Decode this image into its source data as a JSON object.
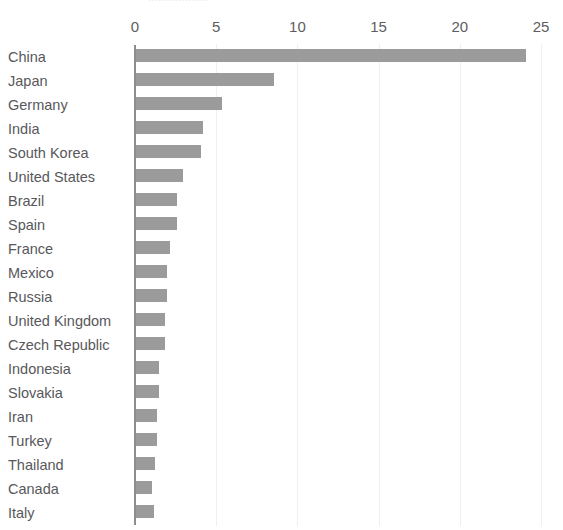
{
  "title_remnant": "..................",
  "colors": {
    "bar": "#9b9b9b",
    "gridline": "#efeff1",
    "axis": "#8d8d8d",
    "label_text": "#58585b",
    "tick_text": "#5d5d60",
    "background": "#ffffff"
  },
  "chart_data": {
    "type": "bar",
    "orientation": "horizontal",
    "title": "",
    "xlabel": "",
    "ylabel": "",
    "xlim": [
      0,
      25
    ],
    "xticks": [
      0,
      5,
      10,
      15,
      20,
      25
    ],
    "xtick_labels": [
      "0",
      "5",
      "10",
      "15",
      "20",
      "25"
    ],
    "grid": true,
    "grid_axis": "x",
    "legend": false,
    "sorted": "descending",
    "categories": [
      "China",
      "Japan",
      "Germany",
      "India",
      "South Korea",
      "United States",
      "Brazil",
      "Spain",
      "France",
      "Mexico",
      "Russia",
      "United Kingdom",
      "Czech Republic",
      "Indonesia",
      "Slovakia",
      "Iran",
      "Turkey",
      "Thailand",
      "Canada",
      "Italy"
    ],
    "values": [
      24.0,
      8.5,
      5.3,
      4.1,
      4.0,
      2.9,
      2.5,
      2.5,
      2.1,
      1.9,
      1.9,
      1.8,
      1.8,
      1.4,
      1.4,
      1.3,
      1.3,
      1.2,
      1.0,
      1.1
    ]
  }
}
